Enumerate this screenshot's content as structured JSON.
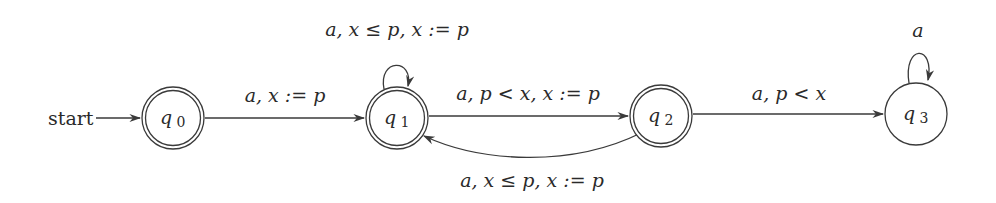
{
  "diagram": {
    "type": "timed-automaton",
    "start_label": "start",
    "states": [
      {
        "id": "q0",
        "name": "q",
        "subscript": "0",
        "accepting": true
      },
      {
        "id": "q1",
        "name": "q",
        "subscript": "1",
        "accepting": true
      },
      {
        "id": "q2",
        "name": "q",
        "subscript": "2",
        "accepting": true
      },
      {
        "id": "q3",
        "name": "q",
        "subscript": "3",
        "accepting": false
      }
    ],
    "transitions": [
      {
        "from": "q0",
        "to": "q1",
        "label": "a, x := p"
      },
      {
        "from": "q1",
        "to": "q1",
        "label": "a, x ≤ p, x := p"
      },
      {
        "from": "q1",
        "to": "q2",
        "label": "a, p < x, x := p"
      },
      {
        "from": "q2",
        "to": "q1",
        "label": "a, x ≤ p, x := p"
      },
      {
        "from": "q2",
        "to": "q3",
        "label": "a, p < x"
      },
      {
        "from": "q3",
        "to": "q3",
        "label": "a"
      }
    ],
    "colors": {
      "stroke": "#3a3a3a",
      "text": "#2a2a2a",
      "background": "#ffffff"
    }
  }
}
